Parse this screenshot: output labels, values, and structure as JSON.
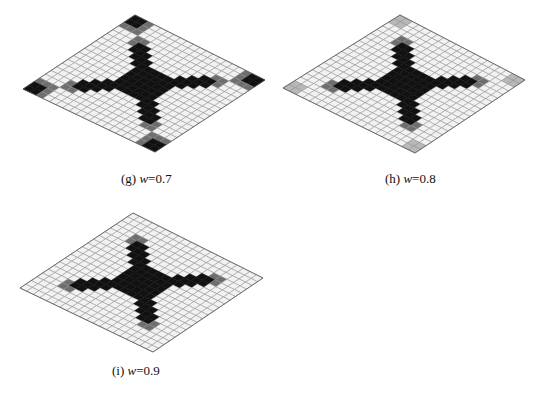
{
  "figure": {
    "grid_size": 20,
    "colors": {
      "empty": "#f2f2f2",
      "line": "#8a8a8a",
      "border": "#555555",
      "dark": "#111111",
      "mid": "#6e6e6e",
      "light": "#b8b8b8"
    },
    "panels": [
      {
        "id": "g",
        "caption_prefix": "(g) ",
        "caption_var": "w",
        "caption_value": "=0.7",
        "corners": {
          "top": [
            135,
            15
          ],
          "right": [
            265,
            80
          ],
          "bottom": [
            155,
            152
          ],
          "left": [
            23,
            89
          ]
        },
        "caption_pos": [
          121,
          180
        ],
        "corner_patches": true,
        "corner_faint": false
      },
      {
        "id": "h",
        "caption_prefix": "(h) ",
        "caption_var": "w",
        "caption_value": "=0.8",
        "corners": {
          "top": [
            400,
            15
          ],
          "right": [
            525,
            80
          ],
          "bottom": [
            415,
            153
          ],
          "left": [
            283,
            88
          ]
        },
        "caption_pos": [
          385,
          180
        ],
        "corner_patches": false,
        "corner_faint": true
      },
      {
        "id": "i",
        "caption_prefix": "(i) ",
        "caption_var": "w",
        "caption_value": "=0.9",
        "corners": {
          "top": [
            133,
            213
          ],
          "right": [
            263,
            278
          ],
          "bottom": [
            153,
            352
          ],
          "left": [
            20,
            288
          ]
        },
        "caption_pos": [
          112,
          372
        ],
        "corner_patches": false,
        "corner_faint": false
      }
    ]
  }
}
